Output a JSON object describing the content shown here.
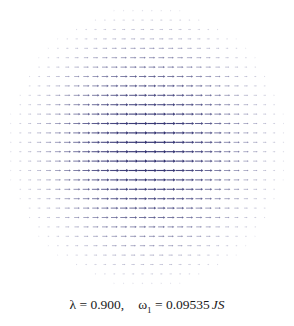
{
  "figure": {
    "title": "",
    "caption": {
      "lambda_symbol": "λ",
      "lambda_equals": " = ",
      "lambda_value": "0.900,",
      "omega_symbol": "ω",
      "omega_subscript": "1",
      "omega_equals": " = ",
      "omega_value": "0.09535",
      "omega_units": "JS",
      "full_text": "λ = 0.900,   ω₁ = 0.09535 JS"
    },
    "colors": {
      "background": "#ffffff",
      "arrow": "#4a4a8c",
      "arrow_core": "#2e2e6e",
      "arrow_faint": "#b8b8d0",
      "caption_text": "#1a1a1a"
    }
  },
  "chart_data": {
    "type": "scatter",
    "subtype": "quiver",
    "title": "",
    "subtitle": "",
    "xlabel": "",
    "ylabel": "",
    "xlim": [
      -1,
      1
    ],
    "ylim": [
      -1,
      1
    ],
    "grid": false,
    "legend": null,
    "annotations": [
      "λ = 0.900",
      "ω₁ = 0.09535 JS"
    ],
    "parameters": {
      "lambda": 0.9,
      "omega_1": 0.09535,
      "omega_units": "JS"
    },
    "field": {
      "description": "Circular domain of horizontal arrows; magnitude peaks at the centre and decays radially to zero at the circular boundary. All arrows point along +x.",
      "grid_nx": 30,
      "grid_ny": 30,
      "domain_shape": "disc",
      "domain_radius": 1.0,
      "arrow_direction_deg": 0,
      "max_magnitude": 1.0,
      "min_magnitude": 0.05,
      "radial_profile": "cos(pi*r/2)"
    },
    "x": [
      -0.966,
      -0.897,
      -0.828,
      -0.759,
      -0.69,
      -0.621,
      -0.552,
      -0.483,
      -0.414,
      -0.345,
      -0.276,
      -0.207,
      -0.138,
      -0.069,
      0.0,
      0.069,
      0.138,
      0.207,
      0.276,
      0.345,
      0.414,
      0.483,
      0.552,
      0.621,
      0.69,
      0.759,
      0.828,
      0.897,
      0.966
    ],
    "y": [
      0.966,
      0.897,
      0.828,
      0.759,
      0.69,
      0.621,
      0.552,
      0.483,
      0.414,
      0.345,
      0.276,
      0.207,
      0.138,
      0.069,
      0.0,
      -0.069,
      -0.138,
      -0.207,
      -0.276,
      -0.345,
      -0.414,
      -0.483,
      -0.552,
      -0.621,
      -0.69,
      -0.759,
      -0.828,
      -0.897,
      -0.966
    ],
    "series": [
      {
        "name": "u (x-component)",
        "description": "u(r) = cos(pi*r/2) for r <= 1, else masked"
      },
      {
        "name": "v (y-component)",
        "description": "v = 0 everywhere"
      }
    ]
  }
}
